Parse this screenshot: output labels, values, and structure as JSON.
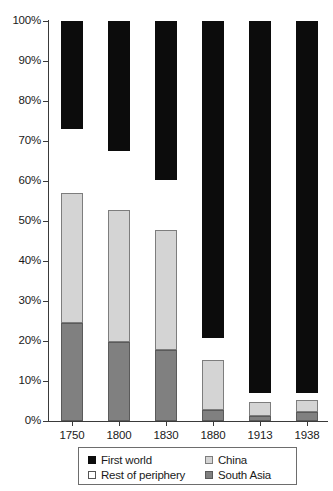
{
  "chart_data": {
    "type": "bar",
    "stacked": true,
    "stack_mode": "percent",
    "title": "",
    "subtitle": "",
    "xlabel": "",
    "ylabel": "",
    "categories": [
      "1750",
      "1800",
      "1830",
      "1880",
      "1913",
      "1938"
    ],
    "series": [
      {
        "name": "South Asia",
        "color": "#808080",
        "values": [
          24.5,
          19.8,
          17.8,
          2.8,
          1.3,
          2.3
        ]
      },
      {
        "name": "China",
        "color": "#d4d4d4",
        "values": [
          32.5,
          33.0,
          30.0,
          12.5,
          3.5,
          3.0
        ]
      },
      {
        "name": "Rest of periphery",
        "color": "#ffffff",
        "values": [
          16.0,
          14.7,
          12.5,
          5.5,
          2.3,
          1.8
        ]
      },
      {
        "name": "First world",
        "color": "#0c0c0c",
        "values": [
          27.0,
          32.5,
          39.7,
          79.2,
          92.9,
          92.9
        ]
      }
    ],
    "ylim": [
      0,
      100
    ],
    "ytick_labels": [
      "100%",
      "90%",
      "80%",
      "70%",
      "60%",
      "50%",
      "40%",
      "30%",
      "20%",
      "10%",
      "0%"
    ],
    "ytick_values": [
      100,
      90,
      80,
      70,
      60,
      50,
      40,
      30,
      20,
      10,
      0
    ],
    "grid": false,
    "legend_position": "bottom",
    "legend_entries": [
      {
        "label": "First world",
        "key": "first-world"
      },
      {
        "label": "Rest of periphery",
        "key": "rest-periphery"
      },
      {
        "label": "China",
        "key": "china"
      },
      {
        "label": "South Asia",
        "key": "south-asia"
      }
    ]
  }
}
